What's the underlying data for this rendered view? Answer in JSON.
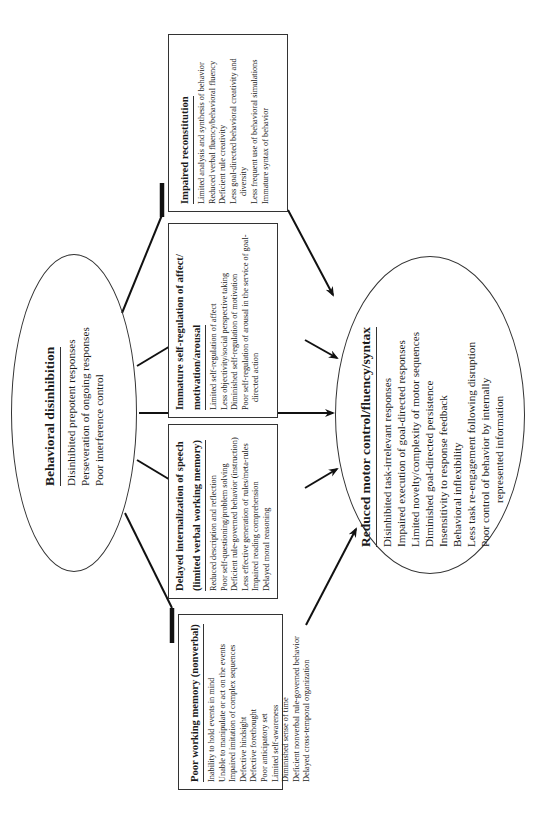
{
  "source_ellipse": {
    "title": "Behavioral disinhibition",
    "items": [
      "Disinhibited prepotent responses",
      "Perseveration of ongoing responses",
      "Poor interference control"
    ]
  },
  "boxes": [
    {
      "id": "poor-working-memory",
      "title": "Poor working memory (nonverbal)",
      "items": [
        "Inability to hold events in mind",
        "Unable to manipulate or act on the events",
        "Impaired imitation of complex sequences",
        "Defective hindsight",
        "Defective forethought",
        "Poor anticipatory set",
        "Limited self-awareness",
        "Diminished sense of time",
        "Deficient nonverbal rule-governed behavior",
        "Delayed cross-temporal organization"
      ]
    },
    {
      "id": "delayed-internalization",
      "title_line1": "Delayed internalization of speech",
      "title_line2": "(limited verbal working memory)",
      "items": [
        "Reduced description and reflection",
        "Poor self-questioning/problem solving",
        "Deficient rule-governed behavior (instruction)",
        "Less effective generation of rules/meta-rules",
        "Impaired reading comprehension",
        "Delayed moral reasoning"
      ]
    },
    {
      "id": "immature-self-regulation",
      "title_line1": "Immature self-regulation of affect/",
      "title_line2": "motivation/arousal",
      "items": [
        "Limited self-regulation of affect",
        "Less objectivity/social perspective taking",
        "Diminished self-regulation of motivation",
        "Poor self-regulation of arousal in the service of goal-directed action"
      ]
    },
    {
      "id": "impaired-reconstitution",
      "title": "Impaired reconstitution",
      "items": [
        "Limited analysis and synthesis of behavior",
        "Reduced verbal fluency/behavioral fluency",
        "Deficient rule creativity",
        "Less goal-directed behavioral creativity and diversity",
        "Less frequent use of behavioral simulations",
        "Immature syntax of behavior"
      ]
    }
  ],
  "target_ellipse": {
    "title": "Reduced motor control/fluency/syntax",
    "items": [
      "Disinhibited task-irrelevant responses",
      "Impaired execution of goal-directed responses",
      "Limited novelty/complexity of motor sequences",
      "Diminished goal-directed persistence",
      "Insensitivity to response feedback",
      "Behavioral inflexibility",
      "Less task re-engagement following disruption",
      "Poor control of behavior by internally",
      "represented information"
    ]
  },
  "connections": {
    "inhibitory": [
      {
        "from": "Behavioral disinhibition",
        "to": "Poor working memory (nonverbal)"
      },
      {
        "from": "Behavioral disinhibition",
        "to": "Delayed internalization of speech"
      },
      {
        "from": "Behavioral disinhibition",
        "to": "Immature self-regulation of affect/motivation/arousal"
      },
      {
        "from": "Behavioral disinhibition",
        "to": "Impaired reconstitution"
      }
    ],
    "excitatory_arrows": [
      {
        "from": "Behavioral disinhibition",
        "to": "Reduced motor control/fluency/syntax"
      },
      {
        "from": "Poor working memory (nonverbal)",
        "to": "Reduced motor control/fluency/syntax"
      },
      {
        "from": "Delayed internalization of speech",
        "to": "Reduced motor control/fluency/syntax"
      },
      {
        "from": "Immature self-regulation of affect/motivation/arousal",
        "to": "Reduced motor control/fluency/syntax"
      },
      {
        "from": "Impaired reconstitution",
        "to": "Reduced motor control/fluency/syntax"
      }
    ]
  },
  "colors": {
    "ink": "#1a1a1a",
    "background": "#ffffff"
  }
}
